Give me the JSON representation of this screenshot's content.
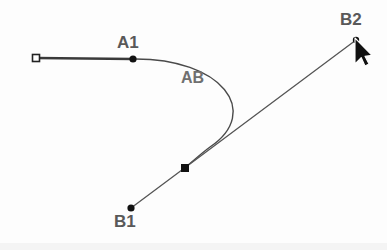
{
  "canvas": {
    "width": 387,
    "height": 250,
    "background_color": "#fdfdfd",
    "bottom_edge_color": "#f2f2f2"
  },
  "style": {
    "label_color": "#595959",
    "segment_label_color": "#707070",
    "stroke_color": "#3a3a3a",
    "curve_color": "#4a4a4a",
    "line_color": "#555555",
    "handle_fill": "#111111",
    "open_square_fill": "#ffffff",
    "open_square_stroke": "#222222"
  },
  "labels": {
    "a1": "A1",
    "ab": "AB",
    "b1": "B1",
    "b2": "B2"
  },
  "points": {
    "a_start_square": {
      "x": 36,
      "y": 58,
      "shape": "open-square",
      "size": 7
    },
    "a1_node": {
      "x": 133,
      "y": 59,
      "shape": "filled-circle",
      "radius": 3.6
    },
    "b1_node": {
      "x": 131,
      "y": 208,
      "shape": "filled-circle",
      "radius": 3.6
    },
    "b2_node": {
      "x": 356,
      "y": 40,
      "shape": "filled-circle",
      "radius": 3.2
    },
    "mid_handle_square": {
      "x": 185,
      "y": 168,
      "shape": "filled-square",
      "size": 8
    }
  },
  "geometry": {
    "straight_segment_a": {
      "x1": 36,
      "y1": 58,
      "x2": 133,
      "y2": 59,
      "width": 2.6
    },
    "straight_segment_b": {
      "x1": 131,
      "y1": 208,
      "x2": 356,
      "y2": 40,
      "width": 1.3
    },
    "curve_ab": {
      "start_x": 133,
      "start_y": 59,
      "c1_x": 222,
      "c1_y": 58,
      "c2_x": 262,
      "c2_y": 112,
      "end_x": 210,
      "end_y": 147,
      "tail_c1_x": 203,
      "tail_c1_y": 152,
      "tail_end_x": 186,
      "tail_end_y": 167,
      "width": 1.4
    }
  },
  "cursor": {
    "name": "mouse-pointer",
    "x": 355,
    "y": 40,
    "fill": "#111111",
    "outline": "#ffffff"
  }
}
